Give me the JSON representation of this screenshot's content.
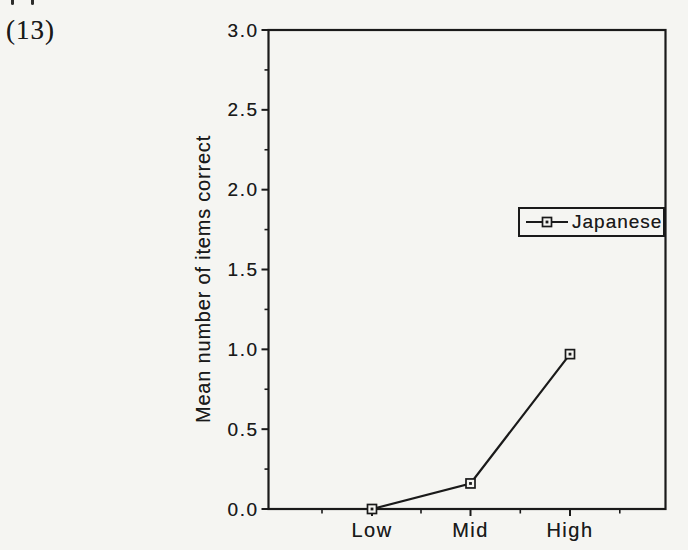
{
  "page": {
    "figure_label": "(13)"
  },
  "colors": {
    "ink": "#1a1a1a",
    "paper": "#f5f5f2"
  },
  "chart_data": {
    "type": "line",
    "title": "",
    "categories": [
      "Low",
      "Mid",
      "High"
    ],
    "series": [
      {
        "name": "Japanese",
        "values": [
          0.0,
          0.16,
          0.97
        ]
      }
    ],
    "xlabel": "",
    "ylabel": "Mean number of items correct",
    "ylim": [
      0.0,
      3.0
    ],
    "ytick_step": 0.5,
    "ytick_labels": [
      "3.0",
      "2.5",
      "2.0",
      "1.5",
      "1.0",
      "0.5",
      "0.0"
    ],
    "grid": false,
    "marker": "open-square-with-center-dot",
    "legend": {
      "position": "center-right",
      "boxed": true,
      "entries": [
        "Japanese"
      ]
    }
  }
}
